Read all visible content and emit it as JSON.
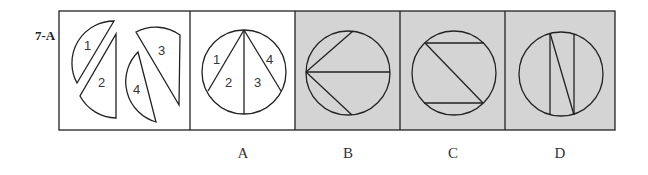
{
  "question": {
    "label": "7-A",
    "pieces": [
      "1",
      "2",
      "3",
      "4"
    ]
  },
  "options": [
    {
      "id": "A",
      "label": "A",
      "background": "#ffffff",
      "numbers": [
        "1",
        "2",
        "3",
        "4"
      ]
    },
    {
      "id": "B",
      "label": "B",
      "background": "#d4d4d4"
    },
    {
      "id": "C",
      "label": "C",
      "background": "#d4d4d4"
    },
    {
      "id": "D",
      "label": "D",
      "background": "#d4d4d4"
    }
  ]
}
